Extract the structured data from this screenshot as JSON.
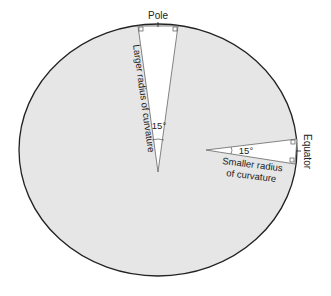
{
  "diagram": {
    "colors": {
      "ellipse_fill": "#e6e6e6",
      "outline": "#222222",
      "wedge_fill": "#ffffff",
      "wedge_line": "#555555"
    },
    "labels": {
      "pole": "Pole",
      "equator": "Equator",
      "larger_radius": "Larger radius of curvature",
      "smaller_radius_line1": "Smaller radius",
      "smaller_radius_line2": "of curvature",
      "pole_angle": "15°",
      "equator_angle": "15°"
    }
  }
}
